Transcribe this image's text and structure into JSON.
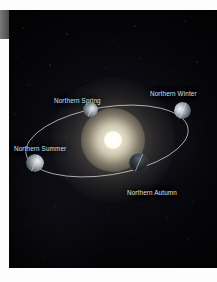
{
  "figure": {
    "background_color": "#050507",
    "page_color": "#ffffff",
    "label_color": "#dfe2e6"
  },
  "sun": {
    "name": "sun",
    "core_color": "#ffffff",
    "glow_color": "#fff4d6"
  },
  "orbit": {
    "name": "elliptical-orbit-path",
    "stroke_color": "#c9ced6"
  },
  "labels": [
    {
      "id": "spring",
      "text": "Northern Spring"
    },
    {
      "id": "winter",
      "text": "Northern Winter"
    },
    {
      "id": "summer",
      "text": "Northern Summer"
    },
    {
      "id": "autumn",
      "text": "Northern Autumn"
    }
  ],
  "bodies": [
    {
      "id": "spring",
      "name": "earth-spring"
    },
    {
      "id": "winter",
      "name": "earth-winter"
    },
    {
      "id": "summer",
      "name": "earth-summer"
    },
    {
      "id": "autumn",
      "name": "earth-autumn"
    }
  ]
}
